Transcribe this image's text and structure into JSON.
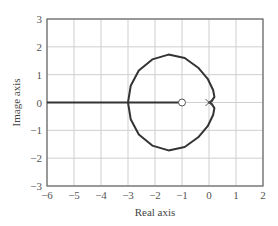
{
  "chart_data": {
    "type": "line",
    "title": "",
    "xlabel": "Real axis",
    "ylabel": "Image axis",
    "xlim": [
      -6,
      2
    ],
    "ylim": [
      -3,
      3
    ],
    "xticks": [
      "−6",
      "−5",
      "−4",
      "−3",
      "−2",
      "−1",
      "0",
      "1",
      "2"
    ],
    "yticks": [
      "3",
      "2",
      "1",
      "0",
      "−1",
      "−2",
      "−3"
    ],
    "grid": true,
    "legend": null,
    "markers": [
      {
        "type": "zero",
        "symbol": "o",
        "x": -1,
        "y": 0
      },
      {
        "type": "pole",
        "symbol": "x",
        "x": 0,
        "y": 0
      }
    ],
    "series": [
      {
        "name": "real-axis-locus",
        "x": [
          -6,
          -1
        ],
        "y": [
          0,
          0
        ]
      },
      {
        "name": "root-locus-loop",
        "x": [
          -3.0,
          -2.9,
          -2.6,
          -2.1,
          -1.5,
          -0.9,
          -0.4,
          -0.05,
          0.15,
          0.2,
          0.1,
          0.0,
          0.1,
          0.2,
          0.15,
          -0.05,
          -0.4,
          -0.9,
          -1.5,
          -2.1,
          -2.6,
          -2.9,
          -3.0
        ],
        "y": [
          0.0,
          0.6,
          1.15,
          1.55,
          1.72,
          1.6,
          1.25,
          0.85,
          0.45,
          0.2,
          0.05,
          0.0,
          -0.05,
          -0.2,
          -0.45,
          -0.85,
          -1.25,
          -1.6,
          -1.72,
          -1.55,
          -1.15,
          -0.6,
          0.0
        ]
      }
    ]
  },
  "axes": {
    "xlabel": "Real axis",
    "ylabel": "Image axis"
  }
}
